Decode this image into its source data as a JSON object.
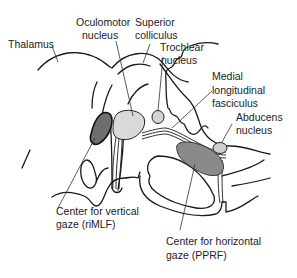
{
  "diagram": {
    "labels": {
      "thalamus": "Thalamus",
      "oculomotor_1": "Oculomotor",
      "oculomotor_2": "nucleus",
      "superior_1": "Superior",
      "superior_2": "colliculus",
      "trochlear_1": "Trochlear",
      "trochlear_2": "nucleus",
      "mlf_1": "Medial",
      "mlf_2": "longitudinal",
      "mlf_3": "fasciculus",
      "abducens_1": "Abducens",
      "abducens_2": "nucleus",
      "vertical_1": "Center for vertical",
      "vertical_2": "gaze (riMLF)",
      "horizontal_1": "Center for horizontal",
      "horizontal_2": "gaze (PPRF)"
    },
    "colors": {
      "riMLF_fill": "#6e6e6e",
      "oculomotor_fill": "#d9d9d9",
      "trochlear_fill": "#d4d4d4",
      "pprf_fill": "#8a8a8a",
      "abducens_fill": "#cfcfcf",
      "line": "#1a1a1a"
    }
  }
}
